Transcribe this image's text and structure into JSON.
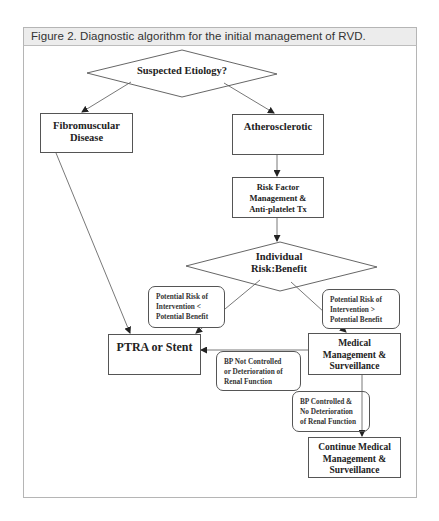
{
  "figure": {
    "title": "Figure 2. Diagnostic algorithm for the initial management of RVD."
  },
  "nodes": {
    "suspected_etiology": {
      "shape": "diamond",
      "text": "Suspected Etiology?"
    },
    "fibromuscular": {
      "shape": "rect",
      "line1": "Fibromuscular",
      "line2": "Disease"
    },
    "atherosclerotic": {
      "shape": "rect",
      "text": "Atherosclerotic"
    },
    "risk_factor": {
      "shape": "rect",
      "line1": "Risk Factor",
      "line2": "Management &",
      "line3": "Anti-platelet Tx"
    },
    "individual_risk": {
      "shape": "diamond",
      "line1": "Individual",
      "line2": "Risk:Benefit"
    },
    "ptra": {
      "shape": "rect",
      "text": "PTRA or Stent"
    },
    "medical_mgmt": {
      "shape": "rect",
      "line1": "Medical",
      "line2": "Management &",
      "line3": "Surveillance"
    },
    "continue_mgmt": {
      "shape": "rect",
      "line1": "Continue Medical",
      "line2": "Management &",
      "line3": "Surveillance"
    }
  },
  "edge_labels": {
    "risk_less": {
      "line1": "Potential Risk of",
      "line2": "Intervention <",
      "line3": "Potential Benefit"
    },
    "risk_greater": {
      "line1": "Potential Risk of",
      "line2": "Intervention >",
      "line3": "Potential Benefit"
    },
    "bp_not_controlled": {
      "line1": "BP Not Controlled",
      "line2": "or Deterioration of",
      "line3": "Renal Function"
    },
    "bp_controlled": {
      "line1": "BP Controlled &",
      "line2": "No Deterioration",
      "line3": "of Renal Function"
    }
  },
  "edges": [
    {
      "from": "Suspected Etiology?",
      "to": "Fibromuscular Disease"
    },
    {
      "from": "Suspected Etiology?",
      "to": "Atherosclerotic"
    },
    {
      "from": "Fibromuscular Disease",
      "to": "PTRA or Stent"
    },
    {
      "from": "Atherosclerotic",
      "to": "Risk Factor Management & Anti-platelet Tx"
    },
    {
      "from": "Risk Factor Management & Anti-platelet Tx",
      "to": "Individual Risk:Benefit"
    },
    {
      "from": "Individual Risk:Benefit",
      "to": "PTRA or Stent",
      "label": "Potential Risk of Intervention < Potential Benefit"
    },
    {
      "from": "Individual Risk:Benefit",
      "to": "Medical Management & Surveillance",
      "label": "Potential Risk of Intervention > Potential Benefit"
    },
    {
      "from": "Medical Management & Surveillance",
      "to": "PTRA or Stent",
      "label": "BP Not Controlled or Deterioration of Renal Function"
    },
    {
      "from": "Medical Management & Surveillance",
      "to": "Continue Medical Management & Surveillance",
      "label": "BP Controlled & No Deterioration of Renal Function"
    }
  ],
  "colors": {
    "header_bg": "#ececec",
    "frame_border": "#b5b5b5",
    "line": "#444444"
  }
}
